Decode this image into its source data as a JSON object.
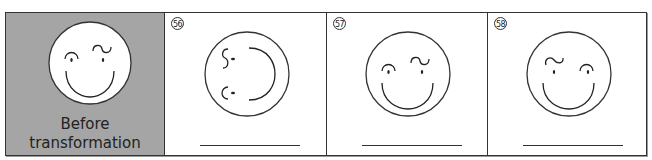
{
  "worksheet": {
    "panels": [
      {
        "id": "before",
        "caption_line1": "Before",
        "caption_line2": "transformation",
        "background": "#a5a5a5",
        "icon": "smiley-face-icon",
        "orientation": "original"
      },
      {
        "id": "56",
        "number": "56",
        "icon": "smiley-face-icon",
        "orientation": "rotated 90° clockwise",
        "answer_blank": ""
      },
      {
        "id": "57",
        "number": "57",
        "icon": "smiley-face-icon",
        "orientation": "same as original",
        "answer_blank": ""
      },
      {
        "id": "58",
        "number": "58",
        "icon": "smiley-face-icon",
        "orientation": "reflected horizontally",
        "answer_blank": ""
      }
    ]
  }
}
